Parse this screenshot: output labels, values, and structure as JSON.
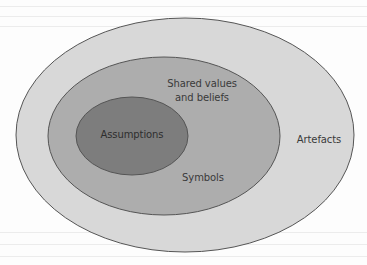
{
  "diagram": {
    "type": "nested-ellipses",
    "colors": {
      "background": "#fdfdfd",
      "outer_fill": "#d8d8d8",
      "middle_fill": "#adadad",
      "inner_fill": "#7d7d7d",
      "stroke": "#555555",
      "text": "#3a3a3a"
    },
    "layers": [
      {
        "id": "outer",
        "label": "Artefacts"
      },
      {
        "id": "middle",
        "label_line1": "Shared values",
        "label_line2": "and beliefs",
        "secondary_label": "Symbols"
      },
      {
        "id": "inner",
        "label": "Assumptions"
      }
    ]
  }
}
